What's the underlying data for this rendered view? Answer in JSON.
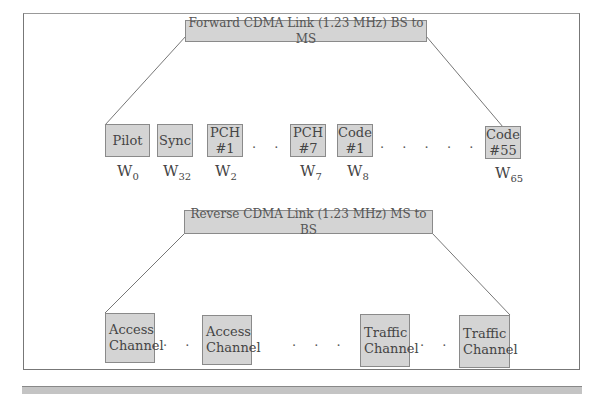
{
  "forward": {
    "title": "Forward CDMA Link  (1.23 MHz) BS to MS",
    "channels": [
      {
        "line1": "Pilot",
        "line2": "",
        "walsh_base": "W",
        "walsh_sub": "0"
      },
      {
        "line1": "Sync",
        "line2": "",
        "walsh_base": "W",
        "walsh_sub": "32"
      },
      {
        "line1": "PCH",
        "line2": "#1",
        "walsh_base": "W",
        "walsh_sub": "2"
      },
      {
        "line1": "PCH",
        "line2": "#7",
        "walsh_base": "W",
        "walsh_sub": "7"
      },
      {
        "line1": "Code",
        "line2": "#1",
        "walsh_base": "W",
        "walsh_sub": "8"
      },
      {
        "line1": "Code",
        "line2": "#55",
        "walsh_base": "W",
        "walsh_sub": "65"
      }
    ],
    "ellipsis": ". . ."
  },
  "reverse": {
    "title": "Reverse CDMA Link (1.23 MHz) MS to BS",
    "channels": [
      {
        "line1": "Access",
        "line2": "Channel"
      },
      {
        "line1": "Access",
        "line2": "Channel"
      },
      {
        "line1": "Traffic",
        "line2": "Channel"
      },
      {
        "line1": "Traffic",
        "line2": "Channel"
      }
    ],
    "ellipsis": ". . ."
  },
  "colors": {
    "box_fill": "#d4d4d4",
    "box_border": "#8a8a8a",
    "line": "#777777"
  }
}
